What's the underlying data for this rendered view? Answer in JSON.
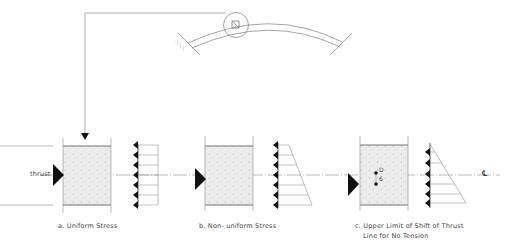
{
  "figure": {
    "type": "structural-diagram",
    "colors": {
      "line": "#555555",
      "fill": "#e8e8e8",
      "arrow": "#111111",
      "background": "#ffffff"
    }
  },
  "labels": {
    "thrust": "thrust",
    "panel_a": "a. Uniform  Stress",
    "panel_b": "b. Non- uniform  Stress",
    "panel_c_line1": "c. Upper  Limit  of  Shift  of  Thrust",
    "panel_c_line2": "Line  for  No  Tension",
    "d_over_6_num": "D",
    "d_over_6_den": "6",
    "centerline_symbol": "℄"
  },
  "panels": [
    {
      "id": "a",
      "stress": "uniform",
      "arrow_count": 7
    },
    {
      "id": "b",
      "stress": "non-uniform (trapezoidal)",
      "arrow_count": 7
    },
    {
      "id": "c",
      "stress": "triangular (no tension)",
      "arrow_count": 6,
      "eccentricity": "D/6"
    }
  ]
}
